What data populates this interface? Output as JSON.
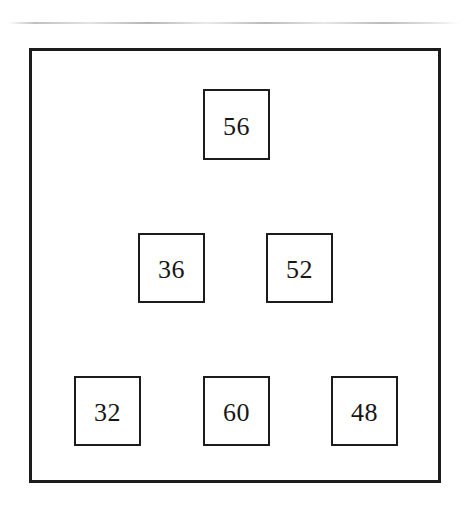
{
  "figure": {
    "background_color": "#ffffff",
    "stroke_color": "#1c1c1c",
    "text_color": "#161616",
    "frame": {
      "x": 29,
      "y": 48,
      "width": 412,
      "height": 435,
      "border_width": 3
    },
    "artifact": {
      "name": "scan-line-artifact",
      "y": 22
    }
  },
  "chart_data": {
    "type": "diagram",
    "title": "",
    "xlabel": "",
    "ylabel": "",
    "layout": "pyramid",
    "rows": 3,
    "node_count": 7,
    "values": [
      56,
      36,
      52,
      32,
      60,
      48
    ],
    "nodes": [
      {
        "id": "node-56",
        "label": "56",
        "row": 1,
        "col": 1,
        "x": 203,
        "y": 89,
        "width": 67,
        "height": 71
      },
      {
        "id": "node-36",
        "label": "36",
        "row": 2,
        "col": 1,
        "x": 138,
        "y": 233,
        "width": 67,
        "height": 70
      },
      {
        "id": "node-52",
        "label": "52",
        "row": 2,
        "col": 2,
        "x": 266,
        "y": 233,
        "width": 67,
        "height": 70
      },
      {
        "id": "node-32",
        "label": "32",
        "row": 3,
        "col": 1,
        "x": 74,
        "y": 376,
        "width": 67,
        "height": 70
      },
      {
        "id": "node-60",
        "label": "60",
        "row": 3,
        "col": 2,
        "x": 203,
        "y": 376,
        "width": 67,
        "height": 70
      },
      {
        "id": "node-48",
        "label": "48",
        "row": 3,
        "col": 3,
        "x": 331,
        "y": 376,
        "width": 67,
        "height": 70
      }
    ]
  }
}
